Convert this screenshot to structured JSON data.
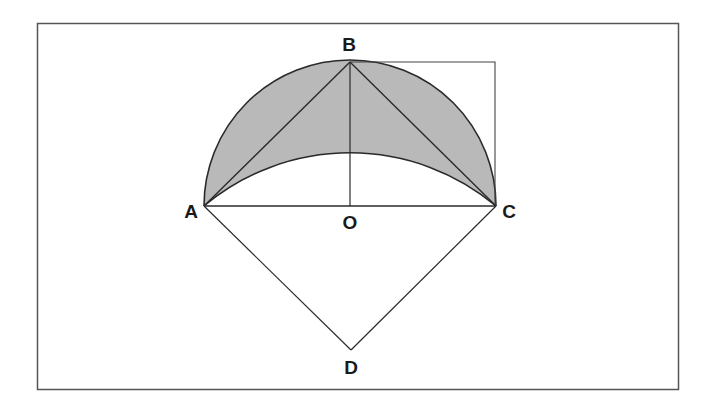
{
  "diagram": {
    "type": "geometry",
    "colors": {
      "background": "#ffffff",
      "frame": "#555555",
      "stroke": "#2a2a2a",
      "shade": "#b9b9b9"
    },
    "points": {
      "A": {
        "label": "A",
        "x": 204,
        "y": 206
      },
      "B": {
        "label": "B",
        "x": 350,
        "y": 62
      },
      "C": {
        "label": "C",
        "x": 496,
        "y": 206
      },
      "O": {
        "label": "O",
        "x": 350,
        "y": 206
      },
      "D": {
        "label": "D",
        "x": 351,
        "y": 350
      }
    },
    "labels": {
      "A": "A",
      "B": "B",
      "C": "C",
      "O": "O",
      "D": "D"
    },
    "segments": [
      "AB",
      "BC",
      "AC",
      "BO",
      "AD",
      "CD",
      "B-corner",
      "corner-C"
    ],
    "arcs": [
      {
        "name": "outer-semicircle",
        "from": "A",
        "to": "C",
        "center": "O",
        "radius": 146
      },
      {
        "name": "inner-arc",
        "from": "A",
        "to": "C",
        "radius": 227
      }
    ],
    "shaded_region": "lune between outer semicircle and inner arc"
  }
}
